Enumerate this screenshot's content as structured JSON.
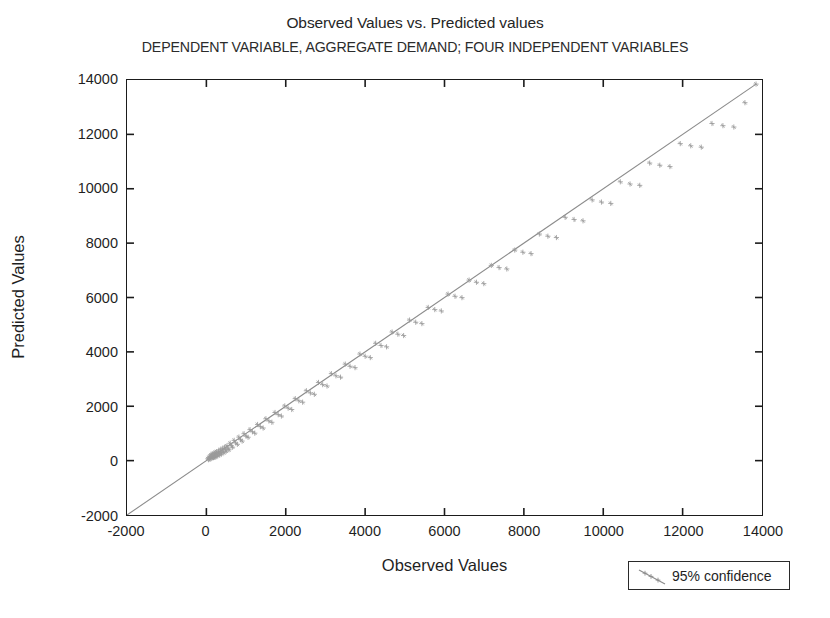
{
  "chart_data": {
    "type": "scatter",
    "title": "Observed Values vs. Predicted values",
    "subtitle": "DEPENDENT VARIABLE, AGGREGATE DEMAND; FOUR INDEPENDENT VARIABLES",
    "xlabel": "Observed Values",
    "ylabel": "Predicted Values",
    "xlim": [
      -2000,
      14000
    ],
    "ylim": [
      -2000,
      14000
    ],
    "xticks": [
      -2000,
      0,
      2000,
      4000,
      6000,
      8000,
      10000,
      12000,
      14000
    ],
    "yticks": [
      -2000,
      0,
      2000,
      4000,
      6000,
      8000,
      10000,
      12000,
      14000
    ],
    "xtick_labels": [
      "-2000",
      "0",
      "2000",
      "4000",
      "6000",
      "8000",
      "10000",
      "12000",
      "14000"
    ],
    "ytick_labels": [
      "-2000",
      "0",
      "2000",
      "4000",
      "6000",
      "8000",
      "10000",
      "12000",
      "14000"
    ],
    "grid": false,
    "legend_position": "outside-bottom-right",
    "legend": [
      {
        "label": "95% confidence",
        "marker": "line",
        "color": "#8c8c8c"
      }
    ],
    "reference_line": {
      "label": "95% confidence",
      "from": [
        -2000,
        -2000
      ],
      "to": [
        13850,
        13850
      ],
      "color": "#8c8c8c",
      "width": 1.1
    },
    "series": [
      {
        "name": "Observed vs Predicted",
        "marker": "plus",
        "color": "#9a9a9a",
        "points": [
          [
            40,
            70
          ],
          [
            55,
            35
          ],
          [
            70,
            120
          ],
          [
            85,
            60
          ],
          [
            95,
            160
          ],
          [
            110,
            95
          ],
          [
            120,
            210
          ],
          [
            130,
            150
          ],
          [
            140,
            90
          ],
          [
            150,
            245
          ],
          [
            160,
            130
          ],
          [
            170,
            190
          ],
          [
            180,
            110
          ],
          [
            190,
            265
          ],
          [
            200,
            175
          ],
          [
            210,
            120
          ],
          [
            220,
            300
          ],
          [
            235,
            205
          ],
          [
            245,
            150
          ],
          [
            260,
            330
          ],
          [
            275,
            230
          ],
          [
            290,
            180
          ],
          [
            305,
            355
          ],
          [
            320,
            265
          ],
          [
            335,
            215
          ],
          [
            350,
            400
          ],
          [
            365,
            300
          ],
          [
            380,
            250
          ],
          [
            400,
            440
          ],
          [
            420,
            345
          ],
          [
            440,
            290
          ],
          [
            460,
            495
          ],
          [
            480,
            400
          ],
          [
            500,
            350
          ],
          [
            520,
            545
          ],
          [
            545,
            455
          ],
          [
            570,
            400
          ],
          [
            600,
            640
          ],
          [
            630,
            545
          ],
          [
            660,
            495
          ],
          [
            700,
            745
          ],
          [
            740,
            650
          ],
          [
            780,
            600
          ],
          [
            820,
            865
          ],
          [
            860,
            770
          ],
          [
            900,
            720
          ],
          [
            950,
            990
          ],
          [
            1000,
            900
          ],
          [
            1050,
            860
          ],
          [
            1100,
            1140
          ],
          [
            1160,
            1060
          ],
          [
            1220,
            1010
          ],
          [
            1290,
            1330
          ],
          [
            1360,
            1250
          ],
          [
            1430,
            1200
          ],
          [
            1500,
            1540
          ],
          [
            1575,
            1460
          ],
          [
            1650,
            1410
          ],
          [
            1730,
            1770
          ],
          [
            1810,
            1690
          ],
          [
            1890,
            1640
          ],
          [
            1975,
            2010
          ],
          [
            2060,
            1930
          ],
          [
            2150,
            1880
          ],
          [
            2240,
            2280
          ],
          [
            2330,
            2200
          ],
          [
            2425,
            2150
          ],
          [
            2520,
            2570
          ],
          [
            2620,
            2490
          ],
          [
            2720,
            2440
          ],
          [
            2825,
            2875
          ],
          [
            2930,
            2795
          ],
          [
            3040,
            2745
          ],
          [
            3150,
            3200
          ],
          [
            3265,
            3120
          ],
          [
            3380,
            3070
          ],
          [
            3500,
            3550
          ],
          [
            3620,
            3470
          ],
          [
            3745,
            3420
          ],
          [
            3870,
            3920
          ],
          [
            4000,
            3840
          ],
          [
            4130,
            3790
          ],
          [
            4265,
            4315
          ],
          [
            4400,
            4235
          ],
          [
            4540,
            4185
          ],
          [
            4680,
            4730
          ],
          [
            4825,
            4650
          ],
          [
            4970,
            4600
          ],
          [
            5120,
            5170
          ],
          [
            5275,
            5090
          ],
          [
            5430,
            5040
          ],
          [
            5590,
            5635
          ],
          [
            5755,
            5555
          ],
          [
            5920,
            5505
          ],
          [
            6090,
            6125
          ],
          [
            6265,
            6045
          ],
          [
            6440,
            5995
          ],
          [
            6620,
            6640
          ],
          [
            6805,
            6560
          ],
          [
            6990,
            6510
          ],
          [
            7180,
            7180
          ],
          [
            7375,
            7100
          ],
          [
            7570,
            7050
          ],
          [
            7770,
            7745
          ],
          [
            7975,
            7665
          ],
          [
            8180,
            7615
          ],
          [
            8390,
            8335
          ],
          [
            8605,
            8255
          ],
          [
            8820,
            8205
          ],
          [
            9040,
            8950
          ],
          [
            9265,
            8870
          ],
          [
            9490,
            8820
          ],
          [
            9720,
            9590
          ],
          [
            9955,
            9510
          ],
          [
            10190,
            9460
          ],
          [
            10430,
            10255
          ],
          [
            10675,
            10175
          ],
          [
            10920,
            10125
          ],
          [
            11170,
            10945
          ],
          [
            11425,
            10865
          ],
          [
            11680,
            10815
          ],
          [
            11940,
            11660
          ],
          [
            12205,
            11580
          ],
          [
            12470,
            11530
          ],
          [
            12740,
            12400
          ],
          [
            13015,
            12320
          ],
          [
            13290,
            12270
          ],
          [
            13570,
            13165
          ],
          [
            13850,
            13850
          ]
        ]
      }
    ]
  }
}
